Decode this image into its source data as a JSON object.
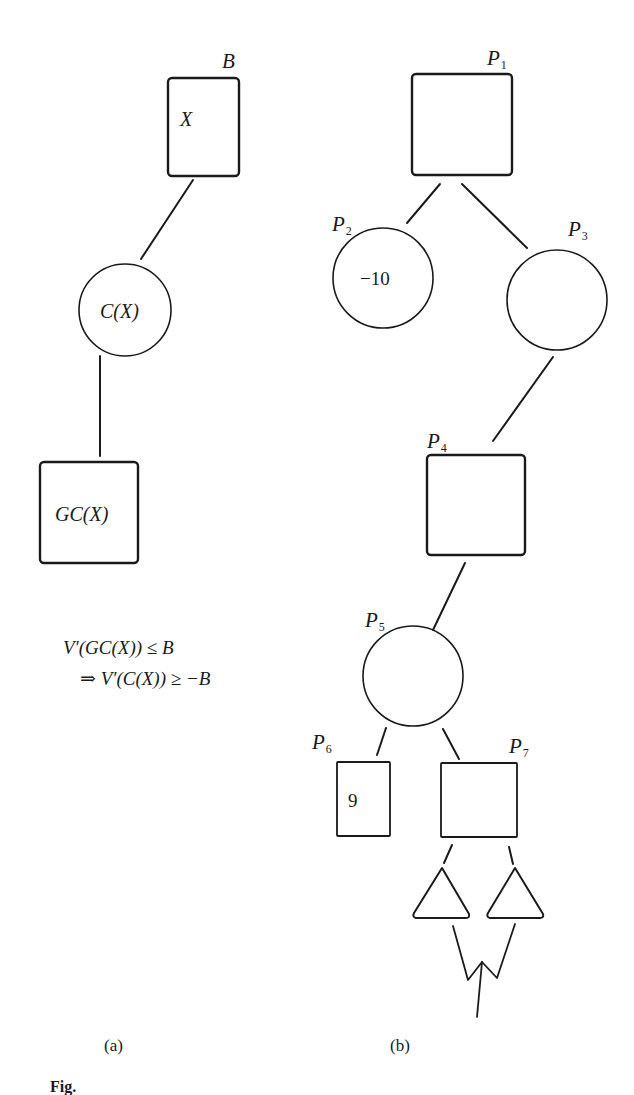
{
  "figure": {
    "caption_prefix": "Fig.",
    "panel_a": {
      "label": "(a)",
      "bound_label": "B",
      "root_node": {
        "shape": "square",
        "text": "X"
      },
      "middle_node": {
        "shape": "circle",
        "text": "C(X)"
      },
      "leaf_node": {
        "shape": "square",
        "text": "GC(X)"
      },
      "formula_line1": "V′(GC(X)) ≤ B",
      "formula_line2": "⇒ V′(C(X)) ≥ −B"
    },
    "panel_b": {
      "label": "(b)",
      "nodes": [
        {
          "id": "P",
          "sub": "1",
          "shape": "square",
          "value": ""
        },
        {
          "id": "P",
          "sub": "2",
          "shape": "circle",
          "value": "−10"
        },
        {
          "id": "P",
          "sub": "3",
          "shape": "circle",
          "value": ""
        },
        {
          "id": "P",
          "sub": "4",
          "shape": "square",
          "value": ""
        },
        {
          "id": "P",
          "sub": "5",
          "shape": "circle",
          "value": ""
        },
        {
          "id": "P",
          "sub": "6",
          "shape": "square",
          "value": "9"
        },
        {
          "id": "P",
          "sub": "7",
          "shape": "square",
          "value": ""
        }
      ],
      "subtrees": [
        {
          "shape": "triangle"
        },
        {
          "shape": "triangle"
        }
      ]
    },
    "colors": {
      "ink": "#1a1a1a",
      "background": "#ffffff"
    }
  }
}
